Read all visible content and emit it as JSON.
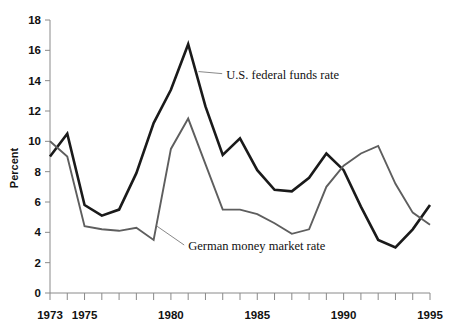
{
  "chart_data": {
    "type": "line",
    "title": "",
    "subtitle": "",
    "xlabel": "",
    "ylabel": "Percent",
    "xlim": [
      1973,
      1995
    ],
    "ylim": [
      0,
      18
    ],
    "grid": false,
    "legend_position": "inline-annotations",
    "x": [
      1973,
      1974,
      1975,
      1976,
      1977,
      1978,
      1979,
      1980,
      1981,
      1982,
      1983,
      1984,
      1985,
      1986,
      1987,
      1988,
      1989,
      1990,
      1991,
      1992,
      1993,
      1994,
      1995
    ],
    "y_ticks": [
      0,
      2,
      4,
      6,
      8,
      10,
      12,
      14,
      16,
      18
    ],
    "y_tick_labels": [
      "0",
      "2",
      "4",
      "6",
      "8",
      "10",
      "12",
      "14",
      "16",
      "18"
    ],
    "x_tick_labels_shown": [
      "1973",
      "1975",
      "1980",
      "1985",
      "1990",
      "1995"
    ],
    "x_tick_label_values": [
      1973,
      1975,
      1980,
      1985,
      1990,
      1995
    ],
    "series": [
      {
        "name": "U.S. federal funds rate",
        "color": "#1a1a1a",
        "values": [
          9.0,
          10.5,
          5.8,
          5.1,
          5.5,
          7.9,
          11.2,
          13.4,
          16.4,
          12.3,
          9.1,
          10.2,
          8.1,
          6.8,
          6.7,
          7.6,
          9.2,
          8.1,
          5.7,
          3.5,
          3.0,
          4.2,
          5.8
        ]
      },
      {
        "name": "German money market rate",
        "color": "#5e5e5e",
        "values": [
          10.0,
          9.0,
          4.4,
          4.2,
          4.1,
          4.3,
          3.5,
          9.5,
          11.5,
          8.5,
          5.5,
          5.5,
          5.2,
          4.6,
          3.9,
          4.2,
          7.0,
          8.4,
          9.2,
          9.7,
          7.2,
          5.3,
          4.5
        ]
      }
    ],
    "annotations": [
      {
        "text": "U.S. federal funds rate",
        "anchor_x": 1981.6,
        "anchor_y": 14.6,
        "label_x": 1983.2,
        "label_y": 14.2
      },
      {
        "text": "German money market rate",
        "anchor_x": 1979.2,
        "anchor_y": 4.4,
        "label_x": 1981.0,
        "label_y": 2.9
      }
    ]
  },
  "axes": {
    "y_axis_title": "Percent"
  }
}
